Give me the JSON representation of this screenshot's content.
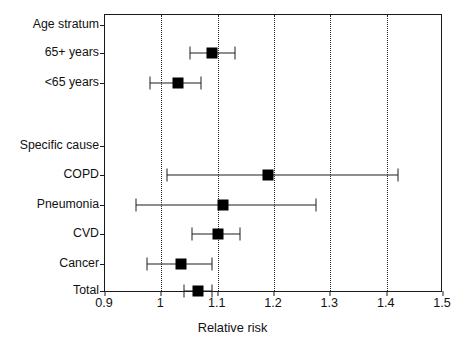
{
  "chart_data": {
    "type": "forest",
    "title": "",
    "xlabel": "Relative risk",
    "ylabel": "",
    "xlim": [
      0.9,
      1.5
    ],
    "xticks": [
      0.9,
      1.0,
      1.1,
      1.2,
      1.3,
      1.4,
      1.5
    ],
    "xticklabels": [
      "0.9",
      "1",
      "1.1",
      "1.2",
      "1.3",
      "1.4",
      "1.5"
    ],
    "gridlines": [
      1.0,
      1.1,
      1.2,
      1.3,
      1.4
    ],
    "grid": "vertical-dotted",
    "legend": "none",
    "marker": "filled-square",
    "rows": [
      {
        "label": "Age stratum",
        "type": "header",
        "estimate": null,
        "ci_low": null,
        "ci_high": null
      },
      {
        "label": "65+ years",
        "type": "data",
        "estimate": 1.09,
        "ci_low": 1.05,
        "ci_high": 1.13
      },
      {
        "label": "<65 years",
        "type": "data",
        "estimate": 1.03,
        "ci_low": 0.98,
        "ci_high": 1.07
      },
      {
        "label": "",
        "type": "spacer",
        "estimate": null,
        "ci_low": null,
        "ci_high": null
      },
      {
        "label": "Specific cause",
        "type": "header",
        "estimate": null,
        "ci_low": null,
        "ci_high": null
      },
      {
        "label": "COPD",
        "type": "data",
        "estimate": 1.19,
        "ci_low": 1.01,
        "ci_high": 1.42
      },
      {
        "label": "Pneumonia",
        "type": "data",
        "estimate": 1.11,
        "ci_low": 0.955,
        "ci_high": 1.275
      },
      {
        "label": "CVD",
        "type": "data",
        "estimate": 1.1,
        "ci_low": 1.055,
        "ci_high": 1.14
      },
      {
        "label": "Cancer",
        "type": "data",
        "estimate": 1.035,
        "ci_low": 0.975,
        "ci_high": 1.09
      },
      {
        "label": "Total",
        "type": "data",
        "estimate": 1.065,
        "ci_low": 1.04,
        "ci_high": 1.09
      }
    ],
    "colors": {
      "marker": "#000000",
      "line": "#1f1f1f",
      "grid": "#262626",
      "frame": "#1a1a1a",
      "text": "#111111",
      "background": "#ffffff"
    }
  }
}
